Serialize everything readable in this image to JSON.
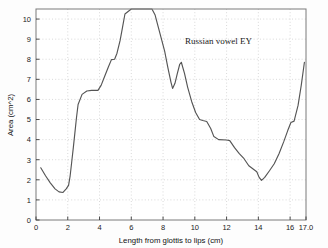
{
  "chart_data": {
    "type": "line",
    "title": "",
    "annotation": "Russian vowel EY",
    "xlabel": "Length from glottis to lips (cm)",
    "ylabel": "Area (cm^2)",
    "xlim": [
      0,
      17.0
    ],
    "ylim": [
      0,
      10.5
    ],
    "grid": true,
    "legend": false,
    "xticks": [
      0,
      2,
      4,
      6,
      8,
      10,
      12,
      14,
      16,
      17.0
    ],
    "xtick_labels": [
      "0",
      "2",
      "4",
      "6",
      "8",
      "10",
      "12",
      "14",
      "16",
      "17.0"
    ],
    "yticks": [
      0,
      1,
      2,
      3,
      4,
      5,
      6,
      7,
      8,
      9,
      10
    ],
    "ytick_labels": [
      "0",
      "1",
      "2",
      "3",
      "4",
      "5",
      "6",
      "7",
      "8",
      "9",
      "10"
    ],
    "line_color": "#555555",
    "series": [
      {
        "name": "area function",
        "x": [
          0.3,
          0.6,
          0.9,
          1.2,
          1.45,
          1.7,
          1.9,
          2.05,
          2.15,
          2.25,
          2.35,
          2.45,
          2.55,
          2.65,
          2.9,
          3.2,
          3.5,
          3.9,
          4.1,
          4.3,
          4.55,
          4.75,
          4.95,
          5.1,
          5.3,
          5.45,
          5.6,
          6.0,
          6.5,
          7.0,
          7.3,
          7.5,
          7.7,
          7.9,
          8.1,
          8.3,
          8.5,
          8.6,
          8.75,
          8.9,
          9.05,
          9.15,
          9.35,
          9.55,
          9.8,
          10.05,
          10.3,
          10.5,
          10.75,
          11.0,
          11.2,
          11.5,
          12.0,
          12.2,
          12.5,
          12.8,
          13.1,
          13.4,
          13.65,
          13.9,
          14.05,
          14.2,
          14.4,
          14.7,
          15.0,
          15.3,
          15.6,
          15.85,
          16.05,
          16.25,
          16.5,
          16.7,
          16.9
        ],
        "y": [
          2.6,
          2.2,
          1.85,
          1.55,
          1.4,
          1.37,
          1.55,
          1.72,
          2.2,
          2.9,
          3.6,
          4.35,
          5.1,
          5.75,
          6.25,
          6.42,
          6.45,
          6.45,
          6.7,
          7.1,
          7.6,
          7.98,
          8.0,
          8.3,
          8.95,
          9.6,
          10.25,
          10.5,
          10.5,
          10.5,
          10.5,
          10.2,
          9.6,
          9.0,
          8.4,
          7.6,
          6.85,
          6.55,
          6.8,
          7.3,
          7.75,
          7.85,
          7.3,
          6.6,
          5.9,
          5.35,
          5.0,
          4.95,
          4.9,
          4.55,
          4.15,
          4.0,
          3.98,
          3.95,
          3.6,
          3.3,
          3.05,
          2.7,
          2.55,
          2.4,
          2.12,
          1.97,
          2.12,
          2.45,
          2.8,
          3.3,
          3.9,
          4.45,
          4.85,
          4.92,
          5.7,
          6.7,
          7.85
        ]
      }
    ]
  },
  "figure": {
    "background": "#fdfdfd",
    "frame_color": "#7a7a7a",
    "grid_color": "#c8c8c8"
  }
}
